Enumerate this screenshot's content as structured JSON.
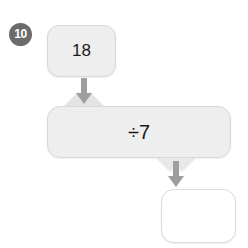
{
  "exercise": {
    "problem_number": "10",
    "type": "function-machine",
    "input_value": "18",
    "operation": "÷7",
    "answer_value": "",
    "answer_placeholder": ""
  },
  "icons": {
    "arrow_down_1": "arrow-down-icon",
    "arrow_down_2": "arrow-down-icon"
  },
  "colors": {
    "badge_background": "#6b6b6b",
    "badge_text": "#ffffff",
    "cell_background": "#eeeeee",
    "cell_border": "#d8d8d8",
    "answer_background": "#ffffff",
    "arrow_fill": "#9e9e9e",
    "wing_fill": "#e2e2e2",
    "page_background": "#ffffff",
    "text": "#1a1a1a"
  }
}
